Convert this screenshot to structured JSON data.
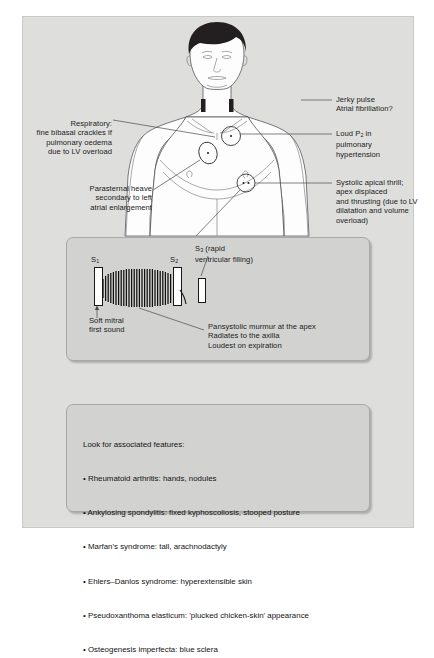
{
  "diagram": {
    "annotations": {
      "jerky_pulse": "Jerky pulse\nAtrial fibrillation?",
      "loud_p2_pre": "Loud P",
      "loud_p2_sub": "2",
      "loud_p2_post": " in\npulmonary\nhypertension",
      "respiratory": "Respiratory:\nfine bibasal crackles if\npulmonary oedema\ndue to LV overload",
      "parasternal": "Parasternal heave\nsecondary to left\natrial enlargement",
      "systolic_thrill": "Systolic apical thrill;\napex displaced\nand thrusting (due to LV\ndilatation and volume\noverload)"
    },
    "phonocardiogram": {
      "s1_label": "S",
      "s1_sub": "1",
      "s2_label": "S",
      "s2_sub": "2",
      "s3_label": "S",
      "s3_sub": "3",
      "s3_text": " (rapid\nventricular filling)",
      "soft_mitral": "Soft mitral\nfirst sound",
      "murmur": "Pansystolic murmur at the apex\nRadiates to the axilla\nLoudest on expiration"
    },
    "features": {
      "heading": "Look for associated features:",
      "items": [
        "• Rheumatoid arthritis: hands, nodules",
        "• Ankylosing spondylitis: fixed kyphoscoliosis, stooped posture",
        "• Marfan's syndrome: tall, arachnodactyly",
        "• Ehlers–Danlos syndrome: hyperextensible skin",
        "• Pseudoxanthoma elasticum: 'plucked chicken-skin' appearance",
        "• Osteogenesis imperfecta: blue sclera"
      ]
    },
    "colors": {
      "frame_bg": "#dededc",
      "panel_bg": "#d2d2d0",
      "ink": "#1b1b1b",
      "hair": "#231f20"
    }
  }
}
